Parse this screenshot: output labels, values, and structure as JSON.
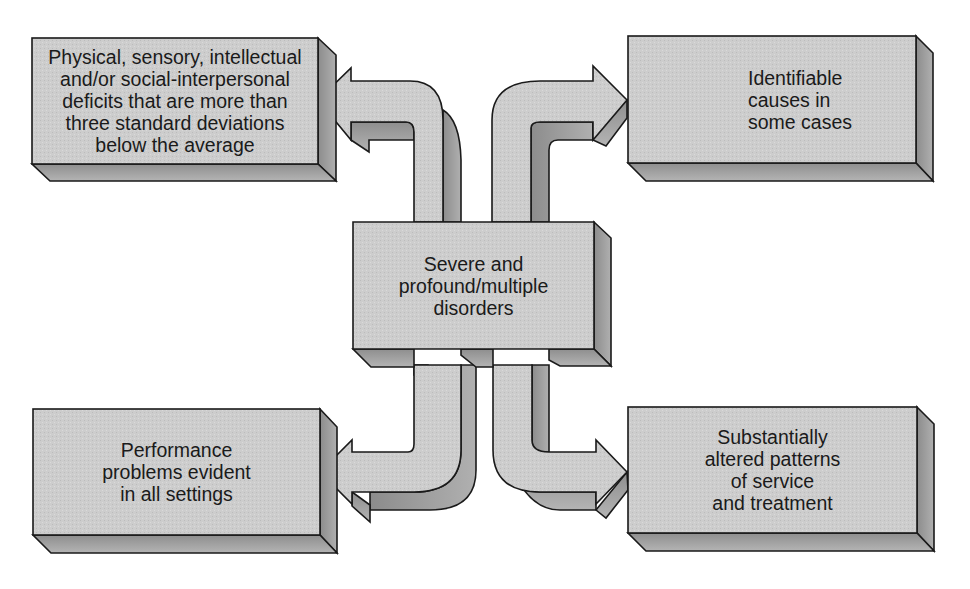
{
  "diagram": {
    "type": "hub-and-spoke",
    "colors": {
      "face": "#cfcfcf",
      "side": "#9a9a9a",
      "bottom": "#a8a8a8",
      "outline": "#1a1a1a",
      "background": "#ffffff",
      "text": "#1a1a1a"
    },
    "center": {
      "label": "Severe and\nprofound/multiple\ndisorders"
    },
    "boxes": [
      {
        "position": "top-left",
        "label": "Physical, sensory, intellectual\nand/or social-interpersonal\ndeficits that are more than\nthree standard deviations\nbelow the average"
      },
      {
        "position": "top-right",
        "label": "Identifiable\ncauses in\nsome cases"
      },
      {
        "position": "bottom-left",
        "label": "Performance\nproblems evident\nin all settings"
      },
      {
        "position": "bottom-right",
        "label": "Substantially\naltered patterns\nof service\nand treatment"
      }
    ],
    "arrows": [
      {
        "from": "center",
        "to": "top-left"
      },
      {
        "from": "center",
        "to": "top-right"
      },
      {
        "from": "center",
        "to": "bottom-left"
      },
      {
        "from": "center",
        "to": "bottom-right"
      }
    ]
  }
}
